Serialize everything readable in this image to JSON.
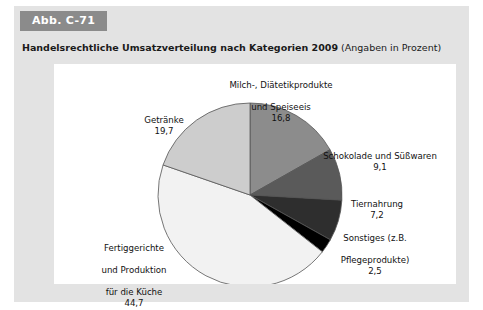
{
  "figure": {
    "badge": "Abb. C-71",
    "title": "Handelsrechtliche Umsatzverteilung nach Kategorien 2009",
    "title_suffix": " (Angaben in Prozent)",
    "badge_color": "#8b8b8b",
    "panel_color": "#e3e3e3",
    "plot_background": "#ffffff"
  },
  "chart_data": {
    "type": "pie",
    "title": "Handelsrechtliche Umsatzverteilung nach Kategorien 2009",
    "subtitle": "(Angaben in Prozent)",
    "unit": "Prozent",
    "start_angle_deg": 0,
    "direction": "clockwise",
    "legend": "none (direct labels)",
    "categories": [
      "Milch-, Diätetikprodukte und Speiseeis",
      "Schokolade und Süßwaren",
      "Tiernahrung",
      "Sonstiges (z.B. Pflegeprodukte)",
      "Fertiggerichte und Produktion für die Küche",
      "Getränke"
    ],
    "values": [
      16.8,
      9.1,
      7.2,
      2.5,
      44.7,
      19.7
    ],
    "value_labels": [
      "16,8",
      "9,1",
      "7,2",
      "2,5",
      "44,7",
      "19,7"
    ],
    "colors": [
      "#8c8c8c",
      "#5a5a5a",
      "#2e2e2e",
      "#000000",
      "#f2f2f2",
      "#cdcdcd"
    ],
    "slice_outline": "#555555",
    "total": 100.0
  },
  "labels": {
    "milch": {
      "line1": "Milch-, Diätetikprodukte",
      "line2": "und Speiseeis",
      "value": "16,8"
    },
    "schokolade": {
      "line1": "Schokolade und Süßwaren",
      "value": "9,1"
    },
    "tiernahrung": {
      "line1": "Tiernahrung",
      "value": "7,2"
    },
    "sonstiges": {
      "line1": "Sonstiges (z.B.",
      "line2": "Pflegeprodukte)",
      "value": "2,5"
    },
    "getraenke": {
      "line1": "Getränke",
      "value": "19,7"
    },
    "fertiggerichte": {
      "line1": "Fertiggerichte",
      "line2": "und Produktion",
      "line3": "für die Küche",
      "value": "44,7"
    }
  }
}
